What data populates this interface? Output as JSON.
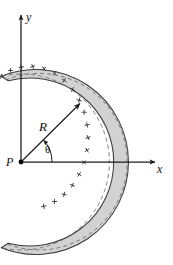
{
  "figure": {
    "background_color": "#ffffff",
    "width": 173,
    "height": 265
  },
  "axes": {
    "x_label": "x",
    "y_label": "y",
    "origin_label": "P",
    "x_axis": {
      "from_x": 21,
      "from_y": 162,
      "to_x": 158,
      "to_y": 162
    },
    "y_axis": {
      "from_x": 21,
      "from_y": 162,
      "to_x": 21,
      "to_y": 13
    },
    "line_color": "#1a1a1a",
    "line_width": 1.2
  },
  "origin_point": {
    "label": "P",
    "x": 21,
    "y": 162,
    "radius": 2.4,
    "color": "#000000"
  },
  "rod": {
    "shape": "circular-arc-band",
    "center_x": 21,
    "center_y": 162,
    "mean_radius": 88,
    "band_thickness": 9,
    "start_angle_deg": 103,
    "end_angle_deg": -103,
    "fill_color": "#d2d2d2",
    "stroke_color": "#3c3c3c",
    "charge_sign": "+",
    "charge_marks": 18,
    "centerline_style": "dashed"
  },
  "radius_indicator": {
    "label": "R",
    "angle_deg": 45,
    "from_x": 21,
    "from_y": 162,
    "to_x": 80,
    "to_y": 103,
    "arrow": "to-arc",
    "color": "#1a1a1a"
  },
  "angle_indicator": {
    "label": "θ",
    "vertex_x": 21,
    "vertex_y": 162,
    "arc_radius": 30,
    "from_angle_deg": 0,
    "to_angle_deg": 45,
    "arrow": "counterclockwise",
    "color": "#1a1a1a"
  }
}
